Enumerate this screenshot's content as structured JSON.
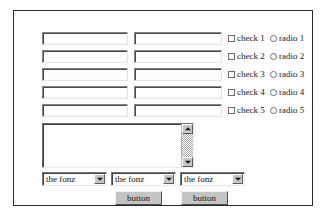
{
  "form": {
    "text_inputs": [
      {
        "name": "text-input-1a",
        "value": "",
        "placeholder": ""
      },
      {
        "name": "text-input-1b",
        "value": "",
        "placeholder": ""
      },
      {
        "name": "text-input-2a",
        "value": "",
        "placeholder": ""
      },
      {
        "name": "text-input-2b",
        "value": "",
        "placeholder": ""
      },
      {
        "name": "text-input-3a",
        "value": "",
        "placeholder": ""
      },
      {
        "name": "text-input-3b",
        "value": "",
        "placeholder": ""
      },
      {
        "name": "text-input-4a",
        "value": "",
        "placeholder": ""
      },
      {
        "name": "text-input-4b",
        "value": "",
        "placeholder": ""
      },
      {
        "name": "text-input-5a",
        "value": "",
        "placeholder": ""
      },
      {
        "name": "text-input-5b",
        "value": "",
        "placeholder": ""
      }
    ],
    "options": [
      {
        "checkbox_label": "check 1",
        "radio_label": "radio 1",
        "checked": false,
        "selected": false
      },
      {
        "checkbox_label": "check 2",
        "radio_label": "radio 2",
        "checked": false,
        "selected": false
      },
      {
        "checkbox_label": "check 3",
        "radio_label": "radio 3",
        "checked": false,
        "selected": false
      },
      {
        "checkbox_label": "check 4",
        "radio_label": "radio 4",
        "checked": false,
        "selected": false
      },
      {
        "checkbox_label": "check 5",
        "radio_label": "radio 5",
        "checked": false,
        "selected": false
      }
    ],
    "textarea": {
      "value": "",
      "placeholder": "",
      "scrollbar": {
        "up_arrow_icon": "triangle-up-icon",
        "down_arrow_icon": "triangle-down-icon"
      }
    },
    "selects": [
      {
        "selected": "the fonz",
        "arrow_icon": "chevron-down-icon"
      },
      {
        "selected": "the fonz",
        "arrow_icon": "chevron-down-icon"
      },
      {
        "selected": "the fonz",
        "arrow_icon": "chevron-down-icon"
      }
    ],
    "buttons": [
      {
        "label": "button"
      },
      {
        "label": "button"
      }
    ]
  },
  "colors": {
    "frame_border": "#2b2b2b",
    "page_background": "#ffffff",
    "control_face": "#c6c6c6",
    "field_background": "#ffffff",
    "text": "#111111"
  }
}
